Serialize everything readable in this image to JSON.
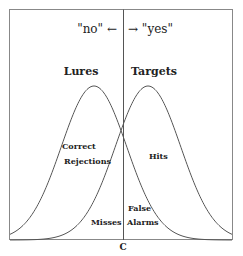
{
  "diagram": {
    "type": "signal-detection",
    "response_labels": {
      "no": "\"no\" ←",
      "yes": "→ \"yes\""
    },
    "distributions": [
      {
        "name": "Lures",
        "peak_x": 94
      },
      {
        "name": "Targets",
        "peak_x": 148
      }
    ],
    "regions": {
      "correct_rejections_line1": "Correct",
      "correct_rejections_line2": "Rejections",
      "hits": "Hits",
      "misses": "Misses",
      "false_alarms_line1": "False",
      "false_alarms_line2": "Alarms"
    },
    "criterion_label": "C",
    "colors": {
      "line": "#555555",
      "text": "#222222",
      "frame": "#888888"
    }
  }
}
